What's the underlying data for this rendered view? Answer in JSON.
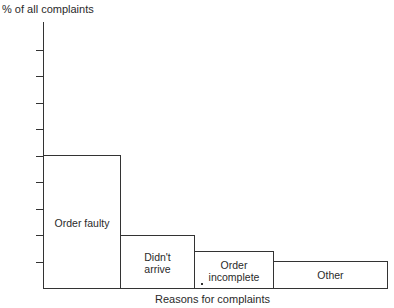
{
  "chart_data": {
    "type": "bar",
    "title": "",
    "xlabel": "Reasons for complaints",
    "ylabel": "% of all complaints",
    "categories": [
      "Order faulty",
      "Didn't arrive",
      "Order incomplete",
      "Other"
    ],
    "category_display": [
      [
        "Order faulty"
      ],
      [
        "Didn't",
        "arrive"
      ],
      [
        "Order",
        "incomplete"
      ],
      [
        "Other"
      ]
    ],
    "values": [
      5.0,
      2.0,
      1.4,
      1.0
    ],
    "value_units": "y-axis tick units (axis has no numeric labels)",
    "y_ticks_count": 9,
    "ylim": [
      0,
      10
    ],
    "tick_labels_shown": false,
    "grid": false,
    "legend": null,
    "bar_widths_px": [
      77,
      74,
      79,
      114
    ],
    "colors": {
      "bar_fill": "#ffffff",
      "bar_edge": "#333333"
    }
  },
  "labels": {
    "y_axis_title": "% of all complaints",
    "x_axis_title": "Reasons for complaints"
  }
}
